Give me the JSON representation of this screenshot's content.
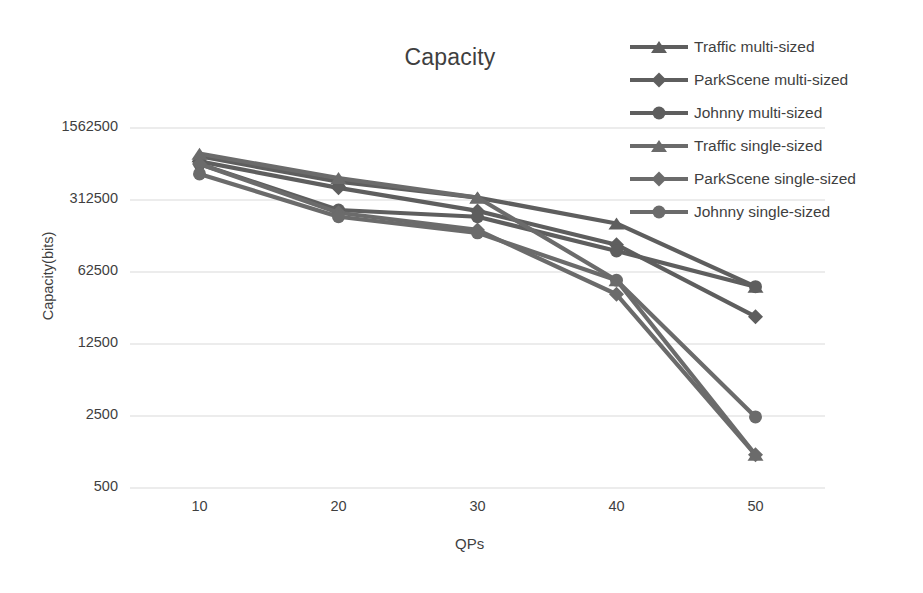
{
  "chart_data": {
    "type": "line",
    "title": "Capacity",
    "xlabel": "QPs",
    "ylabel": "Capacity(bits)",
    "x": [
      10,
      20,
      30,
      40,
      50
    ],
    "xtick_labels": [
      "10",
      "20",
      "30",
      "40",
      "50"
    ],
    "ytick_labels": [
      "1562500",
      "312500",
      "62500",
      "12500",
      "2500",
      "500"
    ],
    "ytick_values": [
      1562500,
      312500,
      62500,
      12500,
      2500,
      500
    ],
    "yscale": "log5",
    "ylim": [
      500,
      1562500
    ],
    "grid": "horizontal",
    "legend_position": "top-right",
    "series": [
      {
        "name": "Traffic multi-sized",
        "marker": "triangle",
        "color": "#5e5e5e",
        "values": [
          830000,
          470000,
          330000,
          185000,
          45000
        ]
      },
      {
        "name": "ParkScene multi-sized",
        "marker": "diamond",
        "color": "#5e5e5e",
        "values": [
          740000,
          410000,
          245000,
          115000,
          23000
        ]
      },
      {
        "name": "Johnny multi-sized",
        "marker": "circle",
        "color": "#5e5e5e",
        "values": [
          700000,
          250000,
          215000,
          100000,
          45000
        ]
      },
      {
        "name": "Traffic single-sized",
        "marker": "triangle",
        "color": "#6b6b6b",
        "values": [
          880000,
          510000,
          330000,
          52000,
          1050
        ]
      },
      {
        "name": "ParkScene  single-sized",
        "marker": "diamond",
        "color": "#6b6b6b",
        "values": [
          700000,
          235000,
          160000,
          38000,
          1050
        ]
      },
      {
        "name": "Johnny single-sized",
        "marker": "circle",
        "color": "#6b6b6b",
        "values": [
          560000,
          215000,
          150000,
          52000,
          2450
        ]
      }
    ]
  }
}
